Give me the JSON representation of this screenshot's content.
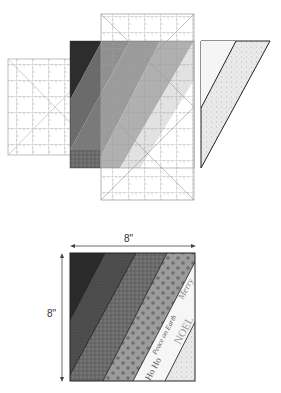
{
  "diagram": {
    "type": "quilting-instruction-illustration",
    "top_figure": {
      "description": "Strip-pieced fabric panel being trimmed with two overlapping square rulers; cut-off triangular offcut shown at right",
      "elements": [
        "left-ruler",
        "center-ruler",
        "strip-set",
        "offcut-triangle"
      ]
    },
    "bottom_figure": {
      "description": "Finished trimmed square block with diagonal fabric strips",
      "width_label": "8\"",
      "height_label": "8\"",
      "strips": [
        {
          "name": "black-solid",
          "color": "#2a2a2a"
        },
        {
          "name": "dark-gray-texture",
          "color": "#4a4a4a"
        },
        {
          "name": "speckled-gray",
          "color": "#6e6e6e"
        },
        {
          "name": "gray-polka-dot",
          "color": "#9a9a9a"
        },
        {
          "name": "white-text-print",
          "color": "#f4f4f4"
        },
        {
          "name": "light-speckle",
          "color": "#e2e2e2"
        }
      ],
      "fabric_text": [
        "Merry",
        "NOEL",
        "Peace on Earth",
        "Ho Ho"
      ]
    },
    "colors": {
      "ruler_line": "#9a9a9a",
      "outline": "#222222",
      "background": "#ffffff"
    }
  }
}
